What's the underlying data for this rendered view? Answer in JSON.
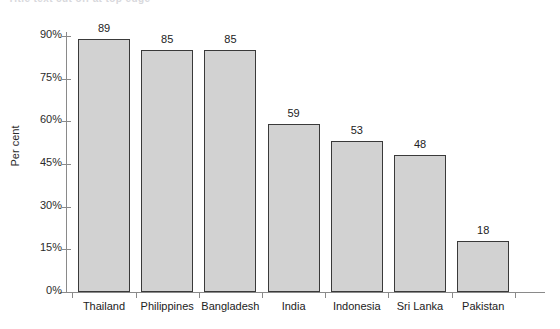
{
  "figure": {
    "cut_off_header_text": "Title text cut off at top edge",
    "background_color": "#ffffff",
    "bar_fill_color": "#d2d2d2",
    "bar_border_color": "#3a3a3a",
    "axis_color": "#8a8a8a",
    "text_color": "#222222"
  },
  "chart_data": {
    "type": "bar",
    "title": "",
    "xlabel": "",
    "ylabel": "Per cent",
    "categories": [
      "Thailand",
      "Philippines",
      "Bangladesh",
      "India",
      "Indonesia",
      "Sri Lanka",
      "Pakistan"
    ],
    "values": [
      89,
      85,
      85,
      59,
      53,
      48,
      18
    ],
    "data_labels": [
      "89",
      "85",
      "85",
      "59",
      "53",
      "48",
      "18"
    ],
    "ylim": [
      0,
      90
    ],
    "ytick_values": [
      0,
      15,
      30,
      45,
      60,
      75,
      90
    ],
    "ytick_labels": [
      "0%",
      "15%",
      "30%",
      "45%",
      "60%",
      "75%",
      "90%"
    ],
    "grid": false,
    "legend": false,
    "legend_position": "none"
  }
}
